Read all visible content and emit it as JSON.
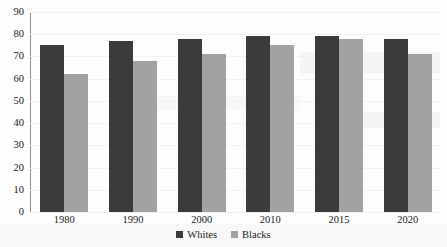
{
  "chart_data": {
    "type": "bar",
    "title": "",
    "subtitle": "",
    "xlabel": "",
    "ylabel": "",
    "categories": [
      "1980",
      "1990",
      "2000",
      "2010",
      "2015",
      "2020"
    ],
    "series": [
      {
        "name": "Whites",
        "color": "#3b3b3b",
        "values": [
          75,
          77,
          78,
          79,
          79,
          78
        ]
      },
      {
        "name": "Blacks",
        "color": "#a2a2a2",
        "values": [
          62,
          68,
          71,
          75,
          78,
          71
        ]
      }
    ],
    "ylim": [
      0,
      90
    ],
    "ytick_step": 10,
    "yticks": [
      90,
      80,
      70,
      60,
      50,
      40,
      30,
      20,
      10,
      0
    ],
    "ytick_labels": [
      "90",
      "80",
      "70",
      "60",
      "50",
      "40",
      "30",
      "20",
      "10",
      "0"
    ],
    "grid": true,
    "legend_position": "bottom",
    "legend_entries": [
      "Whites",
      "Blacks"
    ]
  }
}
